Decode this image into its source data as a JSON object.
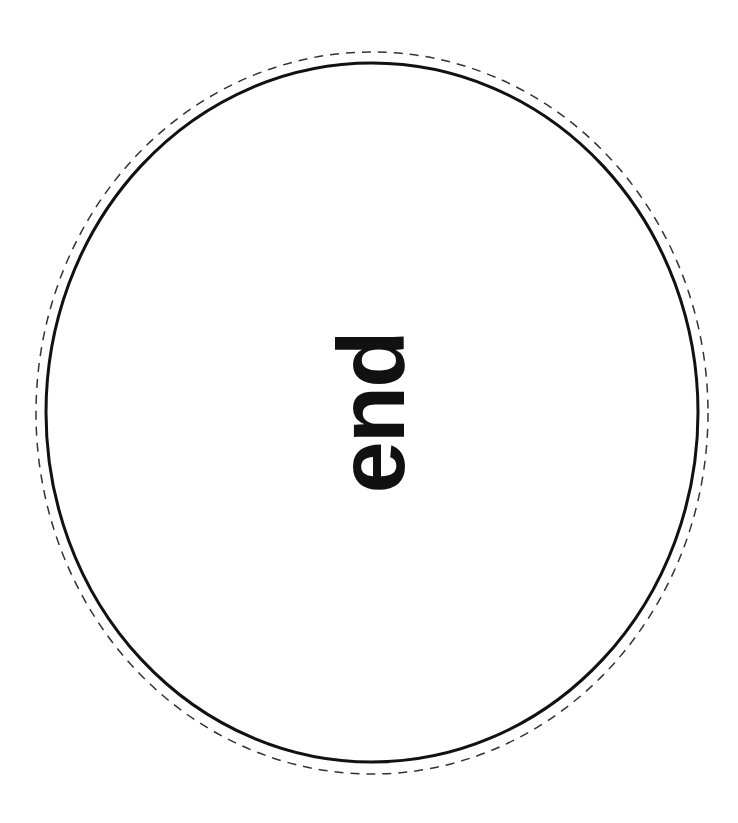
{
  "label": {
    "text": "end",
    "rotation_deg": -90
  },
  "outer_cut_line": {
    "style": "dashed",
    "color": "#333333"
  },
  "inner_circle": {
    "style": "solid",
    "color": "#111111"
  }
}
